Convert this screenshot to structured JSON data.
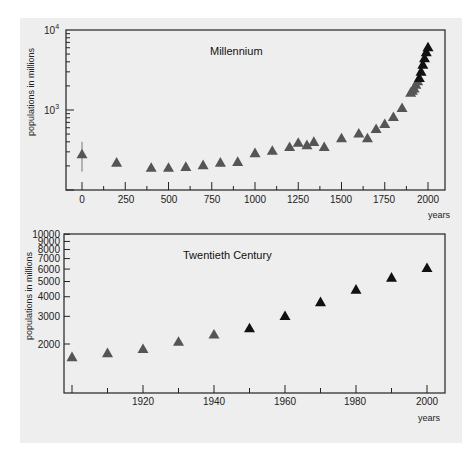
{
  "chart_data": [
    {
      "type": "scatter",
      "title": "Millennium",
      "xlabel": "years",
      "ylabel": "populations in millions",
      "yscale": "log",
      "xlim": [
        -50,
        2040
      ],
      "ylim": [
        100,
        10000
      ],
      "xticks": [
        0,
        250,
        500,
        750,
        1000,
        1250,
        1500,
        1750,
        2000
      ],
      "xtick_labels": [
        "0",
        "250",
        "500",
        "750",
        "1000",
        "1250",
        "1500",
        "1750",
        "2000"
      ],
      "yticks": [
        1000,
        10000
      ],
      "ytick_labels": [
        "10^3",
        "10^4"
      ],
      "marker": "triangle",
      "grid": false,
      "x": [
        0,
        200,
        400,
        500,
        600,
        700,
        800,
        900,
        1000,
        1100,
        1200,
        1250,
        1300,
        1340,
        1400,
        1500,
        1600,
        1650,
        1700,
        1750,
        1800,
        1850,
        1900,
        1910,
        1920,
        1930,
        1940,
        1950,
        1960,
        1970,
        1980,
        1990,
        2000
      ],
      "y": [
        280,
        220,
        190,
        190,
        195,
        205,
        220,
        225,
        290,
        310,
        345,
        390,
        365,
        400,
        345,
        445,
        510,
        445,
        580,
        670,
        820,
        1060,
        1650,
        1750,
        1860,
        2070,
        2300,
        2520,
        3020,
        3700,
        4440,
        5300,
        6100
      ],
      "error_bars": [
        {
          "x": 0,
          "low": 170,
          "high": 400
        }
      ]
    },
    {
      "type": "scatter",
      "title": "Twentieth Century",
      "xlabel": "years",
      "ylabel": "populations in millions",
      "yscale": "log",
      "xlim": [
        1897,
        2012
      ],
      "ylim": [
        1000,
        10000
      ],
      "xticks": [
        1920,
        1940,
        1960,
        1980,
        2000
      ],
      "xtick_labels": [
        "1920",
        "1940",
        "1960",
        "1980",
        "2000"
      ],
      "yticks": [
        2000,
        3000,
        4000,
        5000,
        6000,
        7000,
        8000,
        9000,
        10000
      ],
      "ytick_labels": [
        "2000",
        "3000",
        "4000",
        "5000",
        "6000",
        "7000",
        "8000",
        "9000",
        "10000"
      ],
      "marker": "triangle",
      "grid": false,
      "x": [
        1900,
        1910,
        1920,
        1930,
        1940,
        1950,
        1960,
        1970,
        1980,
        1990,
        2000
      ],
      "y": [
        1650,
        1750,
        1860,
        2070,
        2300,
        2520,
        3020,
        3700,
        4440,
        5300,
        6100
      ]
    }
  ],
  "top": {
    "title": "Millennium",
    "ylabel": "populations in millions",
    "xlabel": "years",
    "ytick_top": "10",
    "ytick_top_exp": "4",
    "ytick_mid": "10",
    "ytick_mid_exp": "3",
    "xtick_labels": [
      "0",
      "250",
      "500",
      "750",
      "1000",
      "1250",
      "1500",
      "1750",
      "2000"
    ]
  },
  "bottom": {
    "title": "Twentieth Century",
    "ylabel": "populations in millions",
    "xlabel": "years",
    "ytick_labels": [
      "2000",
      "3000",
      "4000",
      "5000",
      "6000",
      "7000",
      "8000",
      "9000",
      "10000"
    ],
    "xtick_labels": [
      "1920",
      "1940",
      "1960",
      "1980",
      "2000"
    ]
  },
  "colors": {
    "paper": "#eeeeee",
    "frame": "#222222",
    "marker_gray": "#555555",
    "marker_dark": "#111111"
  }
}
